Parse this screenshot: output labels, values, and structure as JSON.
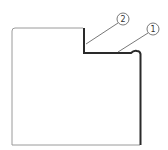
{
  "diagram": {
    "type": "technical-cross-section",
    "colors": {
      "background": "#ffffff",
      "outline": "#9a9a9a",
      "profile": "#2a2a2a",
      "leader": "#555555"
    },
    "callouts": [
      {
        "id": "callout-1",
        "label": "1",
        "target": "horizontal-profile-edge"
      },
      {
        "id": "callout-2",
        "label": "2",
        "target": "vertical-profile-edge"
      }
    ]
  }
}
